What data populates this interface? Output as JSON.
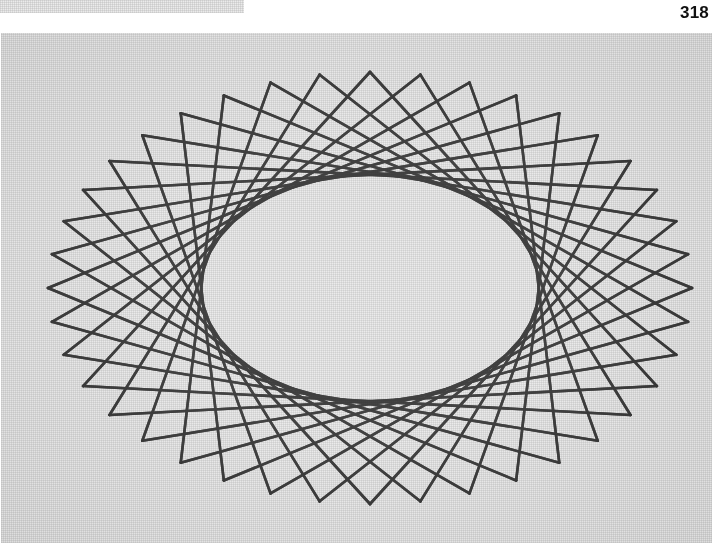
{
  "page": {
    "number": "318",
    "background_color": "#ffffff"
  },
  "scan_artifact": {
    "name": "previous-plate-edge",
    "color": "#ebebeb",
    "x": 0,
    "y": 0,
    "width": 244,
    "height": 13
  },
  "figure": {
    "caption": "",
    "plate_color": "#e9e9e9",
    "ink_color": "#2b2b2b",
    "x": 1,
    "y": 33,
    "width": 711,
    "height": 510
  },
  "chart_data": {
    "type": "scatter",
    "title": "",
    "subtitle": "",
    "xlabel": "",
    "ylabel": "",
    "grid": false,
    "legend": "none",
    "construction": {
      "outer_ellipse": {
        "cx": 369,
        "cy": 255,
        "rx": 322,
        "ry": 216,
        "rotation_deg": 0
      },
      "inner_envelope_ellipse": {
        "cx": 369,
        "cy": 255,
        "rx": 101,
        "ry": 57,
        "rotation_deg": 0
      },
      "point_count": 40,
      "chord_step": 13,
      "start_angle_deg": -90,
      "line_width_px": 2.6,
      "line_color": "#2f2f2f",
      "line_opacity": 0.92
    },
    "x": [
      322.0,
      309.7,
      273.6,
      215.6,
      138.5,
      46.3,
      -56.0,
      -162.3,
      -266.3,
      -361.7
    ],
    "y": [
      0.0,
      33.4,
      65.0,
      93.1,
      116.3,
      133.3,
      143.2,
      145.5,
      140.1,
      127.0
    ],
    "xlim": [
      -322,
      322
    ],
    "ylim": [
      -216,
      216
    ]
  }
}
